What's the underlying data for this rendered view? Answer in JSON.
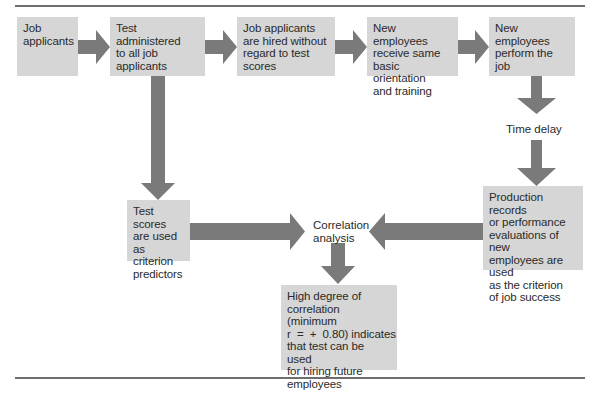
{
  "diagram": {
    "type": "flowchart",
    "colors": {
      "box_fill": "#d6d6d6",
      "arrow_fill": "#7a7a7a",
      "rule": "#6e6e6e",
      "text": "#2a2a2a"
    },
    "nodes": {
      "job_applicants": {
        "lines": [
          "Job",
          "applicants"
        ]
      },
      "test_administered": {
        "lines": [
          "Test administered",
          "to all job",
          "applicants"
        ]
      },
      "hired_without_regard": {
        "lines": [
          "Job applicants",
          "are hired without",
          "regard to test",
          "scores"
        ]
      },
      "orientation": {
        "lines": [
          "New employees",
          "receive same",
          "basic orientation",
          "and training"
        ]
      },
      "perform_job": {
        "lines": [
          "New employees",
          "perform the",
          "job"
        ]
      },
      "time_delay": {
        "lines": [
          "Time delay"
        ]
      },
      "production_records": {
        "lines": [
          "Production records",
          "or performance",
          "evaluations of new",
          "employees are used",
          "as the criterion",
          "of job success"
        ]
      },
      "test_scores": {
        "lines": [
          "Test scores",
          "are used as",
          "criterion",
          "predictors"
        ]
      },
      "correlation_analysis": {
        "lines": [
          "Correlation",
          "analysis"
        ]
      },
      "high_degree": {
        "lines": [
          "High degree of",
          "correlation (minimum",
          "r  =  +  0.80) indicates",
          "that test can be used",
          "for hiring future",
          "employees"
        ]
      }
    },
    "edges": [
      [
        "job_applicants",
        "test_administered"
      ],
      [
        "test_administered",
        "hired_without_regard"
      ],
      [
        "hired_without_regard",
        "orientation"
      ],
      [
        "orientation",
        "perform_job"
      ],
      [
        "perform_job",
        "time_delay"
      ],
      [
        "time_delay",
        "production_records"
      ],
      [
        "test_administered",
        "test_scores"
      ],
      [
        "test_scores",
        "correlation_analysis"
      ],
      [
        "production_records",
        "correlation_analysis"
      ],
      [
        "correlation_analysis",
        "high_degree"
      ]
    ]
  }
}
